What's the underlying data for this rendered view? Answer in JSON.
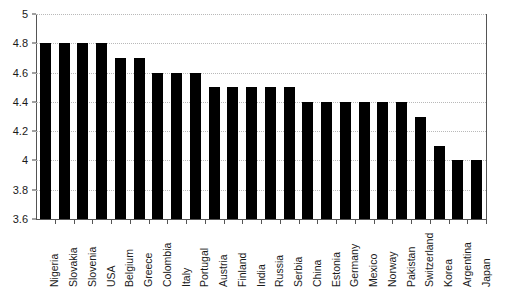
{
  "chart_data": {
    "type": "bar",
    "title": "",
    "xlabel": "",
    "ylabel": "",
    "ylim": [
      3.6,
      5
    ],
    "ytick_step": 0.2,
    "yticks": [
      "3.6",
      "3.8",
      "4",
      "4.2",
      "4.4",
      "4.6",
      "4.8",
      "5"
    ],
    "grid": true,
    "legend": false,
    "bar_color": "#000000",
    "gridline_color": "#b9b9b9",
    "axis_color": "#555555",
    "categories": [
      "Nigeria",
      "Slovakia",
      "Slovenia",
      "USA",
      "Belgium",
      "Greece",
      "Colombia",
      "Italy",
      "Portugal",
      "Austria",
      "Finland",
      "India",
      "Russia",
      "Serbia",
      "China",
      "Estonia",
      "Germany",
      "Mexico",
      "Norway",
      "Pakistan",
      "Switzerland",
      "Korea",
      "Argentina",
      "Japan"
    ],
    "values": [
      4.8,
      4.8,
      4.8,
      4.8,
      4.7,
      4.7,
      4.6,
      4.6,
      4.6,
      4.5,
      4.5,
      4.5,
      4.5,
      4.5,
      4.4,
      4.4,
      4.4,
      4.4,
      4.4,
      4.4,
      4.3,
      4.1,
      4.0,
      4.0
    ]
  }
}
